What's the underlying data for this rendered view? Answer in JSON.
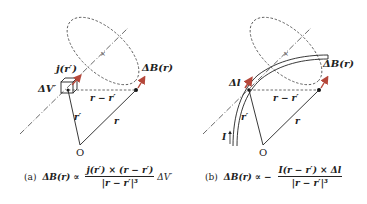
{
  "panel_a": {
    "labels": {
      "current_density": "j(r′)",
      "volume_element": "ΔV′",
      "field_element": "ΔB(r)",
      "displacement": "r − r′",
      "source_position": "r′",
      "field_position": "r",
      "origin": "O"
    },
    "caption": {
      "tag": "(a)",
      "lhs": "ΔB(r) ∝",
      "numerator": "j(r′) × (r − r′)",
      "denominator": "|r − r′|³",
      "tail": "ΔV′"
    }
  },
  "panel_b": {
    "labels": {
      "line_element": "Δl",
      "field_element": "ΔB(r)",
      "displacement": "r − r′",
      "source_position": "r′",
      "field_position": "r",
      "current": "I",
      "origin": "O"
    },
    "caption": {
      "tag": "(b)",
      "lhs": "ΔB(r) ∝ −",
      "numerator": "I(r − r′) × Δl",
      "denominator": "|r − r′|³"
    }
  },
  "colors": {
    "arrow_red": "#b5473a",
    "line": "#333333"
  }
}
